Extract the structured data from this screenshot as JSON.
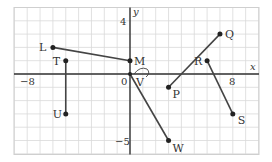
{
  "figure": {
    "x_axis_label": "x",
    "y_axis_label": "y",
    "origin_label": "0",
    "tick_labels": [
      {
        "text": "−8",
        "axis": "x",
        "value": -8
      },
      {
        "text": "8",
        "axis": "x",
        "value": 8
      },
      {
        "text": "4",
        "axis": "y",
        "value": 4
      },
      {
        "text": "−5",
        "axis": "y",
        "value": -5
      }
    ],
    "grid": {
      "xmin": -9,
      "xmax": 10,
      "ymin": -6,
      "ymax": 5,
      "step": 1
    },
    "points": [
      {
        "name": "L",
        "x": -6,
        "y": 2
      },
      {
        "name": "M",
        "x": 0,
        "y": 1
      },
      {
        "name": "T",
        "x": -5,
        "y": 1
      },
      {
        "name": "U",
        "x": -5,
        "y": -3
      },
      {
        "name": "V",
        "x": 0,
        "y": 0
      },
      {
        "name": "W",
        "x": 3,
        "y": -5
      },
      {
        "name": "P",
        "x": 3,
        "y": -1
      },
      {
        "name": "Q",
        "x": 7,
        "y": 3
      },
      {
        "name": "R",
        "x": 6,
        "y": 1
      },
      {
        "name": "S",
        "x": 8,
        "y": -3
      }
    ],
    "segments": [
      [
        "L",
        "M"
      ],
      [
        "T",
        "U"
      ],
      [
        "V",
        "W"
      ],
      [
        "P",
        "Q"
      ],
      [
        "R",
        "S"
      ]
    ],
    "colors": {
      "grid": "#d9d9d9",
      "axis": "#333333",
      "segment": "#444444",
      "point": "#222222"
    }
  }
}
